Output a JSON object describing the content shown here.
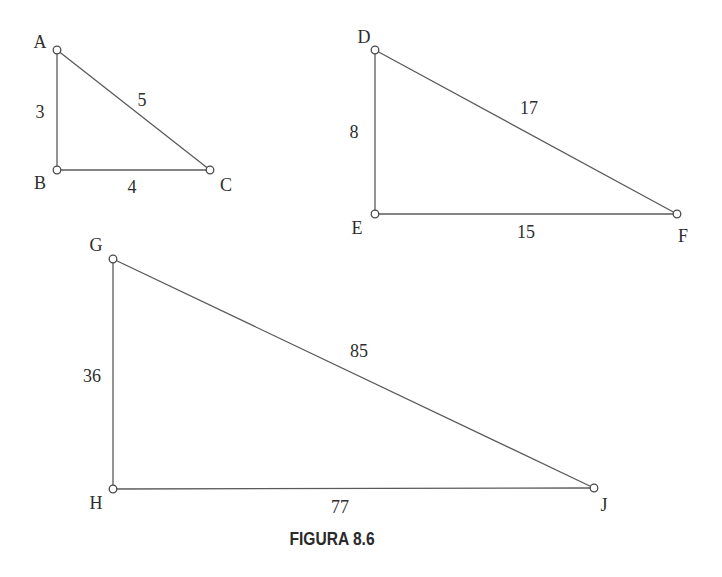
{
  "caption": "FIGURA 8.6",
  "triangles": [
    {
      "id": "ABC",
      "vertices": [
        {
          "label": "A",
          "x": 57,
          "y": 50,
          "lx": 40,
          "ly": 48
        },
        {
          "label": "B",
          "x": 57,
          "y": 170,
          "lx": 40,
          "ly": 189
        },
        {
          "label": "C",
          "x": 210,
          "y": 170,
          "lx": 226,
          "ly": 191
        }
      ],
      "sides": [
        {
          "between": "AB",
          "length": "3",
          "lx": 40,
          "ly": 118
        },
        {
          "between": "AC",
          "length": "5",
          "lx": 142,
          "ly": 106
        },
        {
          "between": "BC",
          "length": "4",
          "lx": 132,
          "ly": 193
        }
      ]
    },
    {
      "id": "DEF",
      "vertices": [
        {
          "label": "D",
          "x": 375,
          "y": 50,
          "lx": 364,
          "ly": 43
        },
        {
          "label": "E",
          "x": 375,
          "y": 214,
          "lx": 357,
          "ly": 234
        },
        {
          "label": "F",
          "x": 677,
          "y": 214,
          "lx": 683,
          "ly": 242
        }
      ],
      "sides": [
        {
          "between": "DE",
          "length": "8",
          "lx": 354,
          "ly": 138
        },
        {
          "between": "DF",
          "length": "17",
          "lx": 529,
          "ly": 114
        },
        {
          "between": "EF",
          "length": "15",
          "lx": 526,
          "ly": 238
        }
      ]
    },
    {
      "id": "GHJ",
      "vertices": [
        {
          "label": "G",
          "x": 113,
          "y": 259,
          "lx": 96,
          "ly": 251
        },
        {
          "label": "H",
          "x": 113,
          "y": 489,
          "lx": 96,
          "ly": 509
        },
        {
          "label": "J",
          "x": 594,
          "y": 488,
          "lx": 604,
          "ly": 511
        }
      ],
      "sides": [
        {
          "between": "GH",
          "length": "36",
          "lx": 92,
          "ly": 382
        },
        {
          "between": "GJ",
          "length": "85",
          "lx": 359,
          "ly": 357
        },
        {
          "between": "HJ",
          "length": "77",
          "lx": 340,
          "ly": 513
        }
      ]
    }
  ]
}
